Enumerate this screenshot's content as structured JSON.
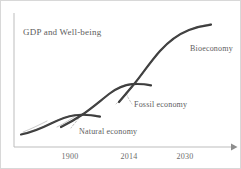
{
  "figure": {
    "title_label": "GDP and Well-being",
    "background_color": "#ffffff",
    "curve_color": "#3a3a3a",
    "axis_color": "#b9b9b9",
    "text_color": "#5d5d5d",
    "leader_color": "#a9a9a9"
  },
  "annotations": {
    "y_axis_label": "GDP and Well-being",
    "phase_1": "Natural economy",
    "phase_2": "Fossil economy",
    "phase_3": "Bioeconomy"
  },
  "chart_data": {
    "type": "line",
    "title": "GDP and Well-being",
    "xlabel": "",
    "ylabel": "GDP and Well-being",
    "grid": false,
    "legend": "none",
    "axis_arrow_x": true,
    "xticks": [
      "1900",
      "2014",
      "2030"
    ],
    "xtick_positions": [
      69,
      128,
      184
    ],
    "xlim": [
      1840,
      2045
    ],
    "ylim": [
      0,
      100
    ],
    "annotations": [
      {
        "text": "GDP and Well-being",
        "x": 22,
        "y": 27
      },
      {
        "text": "Natural economy",
        "x": 78,
        "y": 127
      },
      {
        "text": "Fossil economy",
        "x": 133,
        "y": 100
      },
      {
        "text": "Bioeconomy",
        "x": 189,
        "y": 44
      }
    ],
    "series": [
      {
        "name": "Natural economy",
        "values": [
          3,
          5,
          9,
          15,
          20,
          23,
          24,
          24
        ],
        "x": [
          1845,
          1860,
          1875,
          1888,
          1898,
          1906,
          1914,
          1922
        ]
      },
      {
        "name": "Fossil economy",
        "values": [
          18,
          24,
          33,
          44,
          54,
          60,
          62,
          62
        ],
        "x": [
          1900,
          1918,
          1940,
          1965,
          1990,
          2008,
          2016,
          2022
        ]
      },
      {
        "name": "Bioeconomy",
        "values": [
          50,
          58,
          68,
          78,
          86,
          91,
          93,
          94
        ],
        "x": [
          2000,
          2006,
          2012,
          2018,
          2026,
          2034,
          2040,
          2044
        ]
      }
    ]
  }
}
